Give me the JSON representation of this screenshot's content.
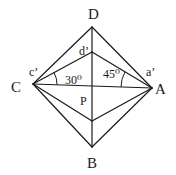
{
  "diagram": {
    "points": {
      "D": {
        "label": "D",
        "x": 92,
        "y": 27
      },
      "d_prime": {
        "label": "d'",
        "x": 92,
        "y": 52
      },
      "C": {
        "label": "C",
        "x": 33,
        "y": 84
      },
      "A": {
        "label": "A",
        "x": 152,
        "y": 88
      },
      "P": {
        "label": "P",
        "x": 92,
        "y": 87
      },
      "lower": {
        "label": "",
        "x": 92,
        "y": 121
      },
      "B": {
        "label": "B",
        "x": 92,
        "y": 147
      }
    },
    "labels": {
      "D": "D",
      "d_prime": "d’",
      "C": "C",
      "c_prime": "c’",
      "A": "A",
      "a_prime": "a’",
      "P": "P",
      "B": "B"
    },
    "angles": {
      "angle_C": {
        "value": "30",
        "unit": "0",
        "text": "30⁰"
      },
      "angle_A": {
        "value": "45",
        "unit": "0",
        "text": "45⁰"
      }
    },
    "colors": {
      "stroke": "#1a1a1a",
      "background": "#ffffff"
    }
  }
}
